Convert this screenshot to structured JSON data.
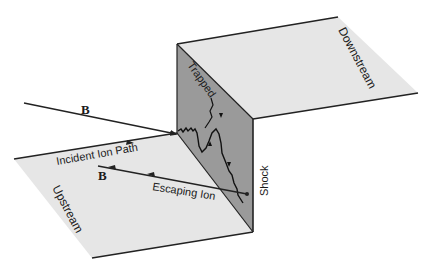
{
  "figure": {
    "type": "shock-geometry-diagram",
    "colors": {
      "plane_fill": "#e6e6e6",
      "shock_fill": "#9a9a9a",
      "line": "#222222",
      "background": "#ffffff"
    },
    "labels": {
      "downstream": "Downstream",
      "upstream": "Upstream",
      "trapped": "Trapped",
      "shock": "Shock",
      "incident_ion_path": "Incident Ion Path",
      "escaping_ion": "Escaping Ion",
      "b_field_upper": "B",
      "b_field_lower": "B"
    }
  }
}
